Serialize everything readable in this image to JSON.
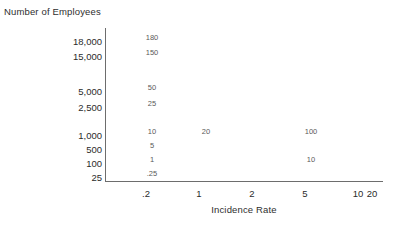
{
  "chart_data": {
    "type": "scatter",
    "title": "",
    "ylabel": "Number of Employees",
    "xlabel": "Incidence Rate",
    "grid": false,
    "legend": "none",
    "y_ticks": [
      "18,000",
      "15,000",
      "5,000",
      "2,500",
      "1,000",
      "500",
      "100",
      "25"
    ],
    "x_ticks": [
      ".2",
      "1",
      "2",
      "5",
      "10",
      "20"
    ],
    "xlim": [
      0.2,
      20
    ],
    "ylim": [
      25,
      18000
    ],
    "annotations": [
      {
        "text": "180",
        "x": "1",
        "y": "18,000"
      },
      {
        "text": "150",
        "x": "1",
        "y": "15,000"
      },
      {
        "text": "50",
        "x": "1",
        "y": "5,000"
      },
      {
        "text": "25",
        "x": "1",
        "y": "2,500"
      },
      {
        "text": "10",
        "x": "1",
        "y": "1,000"
      },
      {
        "text": "20",
        "x": "2",
        "y": "1,000"
      },
      {
        "text": "100",
        "x": "10",
        "y": "1,000"
      },
      {
        "text": "5",
        "x": "1",
        "y": "500"
      },
      {
        "text": "1",
        "x": "1",
        "y": "100"
      },
      {
        "text": "10",
        "x": "10",
        "y": "100"
      },
      {
        "text": ".25",
        "x": "1",
        "y": "25"
      }
    ],
    "colors": {
      "axis": "#6d6d6d",
      "tick_text": "#2b2b2b",
      "value_text": "#5a5a5a",
      "title_text": "#2e2e2e",
      "background": "#ffffff"
    }
  },
  "layout": {
    "y_tick_positions": [
      36,
      51,
      86,
      102,
      130,
      144,
      158,
      172
    ],
    "x_tick_positions": [
      146,
      199,
      252,
      305,
      358,
      372
    ],
    "x_tick_pixels": [
      146,
      199,
      252,
      305,
      358,
      372
    ],
    "annotation_positions": [
      {
        "left": 152,
        "top": 33
      },
      {
        "left": 152,
        "top": 48
      },
      {
        "left": 152,
        "top": 83
      },
      {
        "left": 152,
        "top": 99
      },
      {
        "left": 152,
        "top": 127
      },
      {
        "left": 206,
        "top": 127
      },
      {
        "left": 311,
        "top": 127
      },
      {
        "left": 152,
        "top": 141
      },
      {
        "left": 152,
        "top": 155
      },
      {
        "left": 311,
        "top": 155
      },
      {
        "left": 152,
        "top": 169
      }
    ]
  }
}
